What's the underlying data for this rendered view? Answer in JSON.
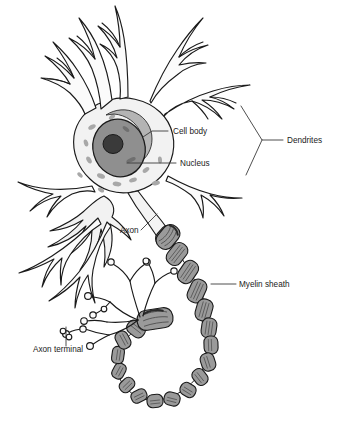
{
  "figure": {
    "background_color": "#ffffff",
    "outline_color": "#1a1a1a"
  },
  "colors": {
    "soma_fill": "#f2f2f2",
    "dendrite_fill": "#fbfbfb",
    "nucleus_fill": "#8f8f8f",
    "nucleolus_fill": "#3a3a3a",
    "nissl_fill": "#a8a8a8",
    "myelin_fill": "#9a9a9a",
    "myelin_highlight": "#c8c8c8",
    "axon_fill": "#f4f4f4",
    "outline": "#1a1a1a",
    "leader_line": "#3b3b3b",
    "text": "#1a1a1a"
  },
  "labels": [
    {
      "id": "cell-body",
      "text": "Cell body",
      "x": 173,
      "y": 134,
      "anchor": "start",
      "leader": "M 168 131 L 152 131 L 143 137"
    },
    {
      "id": "nucleus",
      "text": "Nucleus",
      "x": 180,
      "y": 166,
      "anchor": "start",
      "leader": "M 176 163 L 127 163"
    },
    {
      "id": "dendrites",
      "text": "Dendrites",
      "x": 287,
      "y": 143,
      "anchor": "start",
      "leader": "M 283 140 L 262 140 L 241 106 M 262 140 L 246 175"
    },
    {
      "id": "axon",
      "text": "Axon",
      "x": 120,
      "y": 233,
      "anchor": "start",
      "leader": "M 141 230 L 157 214"
    },
    {
      "id": "myelin-sheath",
      "text": "Myelin sheath",
      "x": 239,
      "y": 287,
      "anchor": "start",
      "leader": "M 236 284 L 211 284"
    },
    {
      "id": "axon-terminal",
      "text": "Axon terminal",
      "x": 33,
      "y": 352,
      "anchor": "start",
      "leader": "M 66 346 L 66 327"
    }
  ],
  "parts": {
    "soma": "cell body",
    "nucleus": "nucleus",
    "nucleolus": "nucleolus",
    "nissl_bodies": "nissl bodies",
    "dendrites": "dendrites",
    "axon_hillock": "axon hillock",
    "axon": "axon",
    "myelin_segments": "myelin sheath segments",
    "nodes_of_ranvier": "nodes of ranvier",
    "axon_terminals": "axon terminal branches",
    "terminal_boutons": "terminal boutons"
  }
}
